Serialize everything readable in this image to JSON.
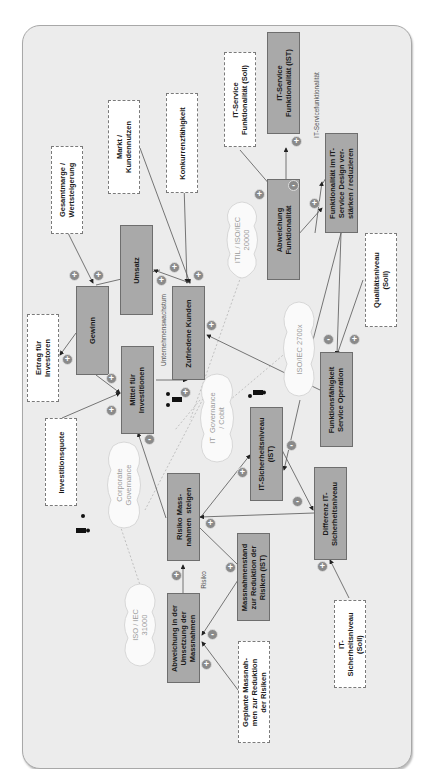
{
  "diagram": {
    "orientation": "rotated 90 degrees counter-clockwise",
    "variables": [
      {
        "id": "it_service_ist",
        "label": "IT-Service\nFunktionalität (IST)"
      },
      {
        "id": "abweichung_funktionalitaet",
        "label": "Abweichung\nFunktionalität"
      },
      {
        "id": "funktionalitaet_design",
        "label": "Funktionalität im IT-\nService Design ver-\nstärken / reduzieren"
      },
      {
        "id": "umsatz",
        "label": "Umsatz"
      },
      {
        "id": "gewinn",
        "label": "Gewinn"
      },
      {
        "id": "zufriedene_kunden",
        "label": "Zufriedene Kunden"
      },
      {
        "id": "mittel_investitionen",
        "label": "Mittel für\nInvestitionen"
      },
      {
        "id": "funktionsfaehigkeit",
        "label": "Funktionsfähigkeit\nService Operation"
      },
      {
        "id": "it_sicherheit_ist",
        "label": "IT-Sicherheitsniveau\n(IST)"
      },
      {
        "id": "differenz_sicherheit",
        "label": "Differenz IT-\nSicherheitsniveau"
      },
      {
        "id": "risiko_massnahmen",
        "label": "Risiko Mass-\nnahmen  steigen"
      },
      {
        "id": "massnahmenstand",
        "label": "Massnahmenstand\nzur Reduktion der\nRisiken (IST)"
      },
      {
        "id": "abweichung_umsetzung",
        "label": "Abweichung in der\nUmsetzung der\nMassnahmen"
      }
    ],
    "externals": [
      {
        "id": "it_service_soll",
        "label": "IT-Service\nFunktionalität (Soll)"
      },
      {
        "id": "konkurrenz",
        "label": "Konkurrenzfähigkeit"
      },
      {
        "id": "markt",
        "label": "Markt /\nKundennutzen"
      },
      {
        "id": "gesamtmarge",
        "label": "Gesamtmarge /\nWertsteigerung"
      },
      {
        "id": "ertrag",
        "label": "Ertrag für\nInvestoren"
      },
      {
        "id": "investitionsquote",
        "label": "Investitionsquote"
      },
      {
        "id": "qualitaet_soll",
        "label": "Qualitätsniveau\n(Soll)"
      },
      {
        "id": "it_sicherheit_soll",
        "label": "IT-\nSicherheitsniveau\n(Soll)"
      },
      {
        "id": "geplante_massnahmen",
        "label": "Geplante Massnah-\nmen zur Reduktion\nder Risiken"
      }
    ],
    "clouds": [
      {
        "id": "itil",
        "label": "ITIL / ISO/IEC\n20000"
      },
      {
        "id": "iso27",
        "label": "ISO/IEC 2700x"
      },
      {
        "id": "itgov",
        "label": "IT  Governance\n/ Cobit"
      },
      {
        "id": "corpgov",
        "label": "Corporate\nGovernance"
      },
      {
        "id": "iso31",
        "label": "ISO / IEC\n31000"
      }
    ],
    "loop_labels": {
      "servicefunktionalitaet": "IT-Servicefunktionalität",
      "unternehmenswachstum": "Unternehmenswachstum",
      "risiko": "Risiko"
    },
    "polarity": {
      "plus": "+",
      "minus": "-"
    },
    "colors": {
      "background": "#ececec",
      "variable_fill": "#a9a9a9",
      "external_fill": "#ffffff",
      "badge": "#8a8a8a",
      "line": "#555555"
    }
  }
}
